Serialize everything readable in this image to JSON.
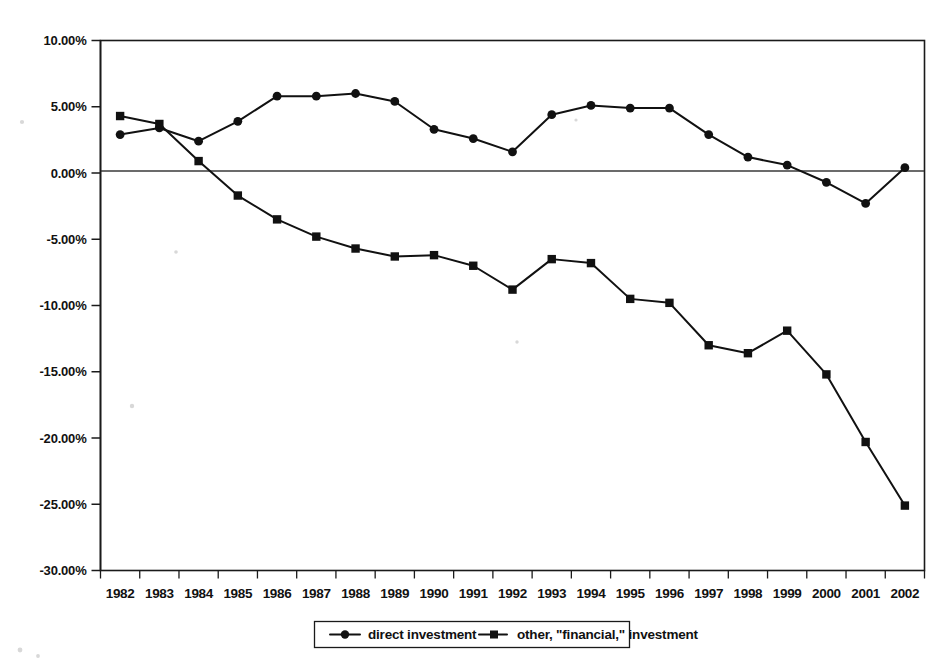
{
  "chart_data": {
    "type": "line",
    "title": "",
    "subtitle": "",
    "xlabel": "",
    "ylabel": "",
    "grid": false,
    "legend_position": "bottom",
    "x": [
      "1982",
      "1983",
      "1984",
      "1985",
      "1986",
      "1987",
      "1988",
      "1989",
      "1990",
      "1991",
      "1992",
      "1993",
      "1994",
      "1995",
      "1996",
      "1997",
      "1998",
      "1999",
      "2000",
      "2001",
      "2002"
    ],
    "categories": [
      "1982",
      "1983",
      "1984",
      "1985",
      "1986",
      "1987",
      "1988",
      "1989",
      "1990",
      "1991",
      "1992",
      "1993",
      "1994",
      "1995",
      "1996",
      "1997",
      "1998",
      "1999",
      "2000",
      "2001",
      "2002"
    ],
    "ylim": [
      -30.0,
      10.0
    ],
    "ytick_values": [
      10.0,
      5.0,
      0.0,
      -5.0,
      -10.0,
      -15.0,
      -20.0,
      -25.0,
      -30.0
    ],
    "ytick_labels": [
      "10.00%",
      "5.00%",
      "0.00%",
      "-5.00%",
      "-10.00%",
      "-15.00%",
      "-20.00%",
      "-25.00%",
      "-30.00%"
    ],
    "unit": "%",
    "series": [
      {
        "name": "direct investment",
        "marker": "circle",
        "values": [
          2.9,
          3.4,
          2.4,
          3.9,
          5.8,
          5.8,
          6.0,
          5.4,
          3.3,
          2.6,
          1.6,
          4.4,
          5.1,
          4.9,
          4.9,
          2.9,
          1.2,
          0.6,
          -0.7,
          -2.3,
          0.4
        ]
      },
      {
        "name": "other, \"financial,\" investment",
        "marker": "square",
        "values": [
          4.3,
          3.7,
          0.9,
          -1.7,
          -3.5,
          -4.8,
          -5.7,
          -6.3,
          -6.2,
          -7.0,
          -8.8,
          -6.5,
          -6.8,
          -9.5,
          -9.8,
          -13.0,
          -13.6,
          -11.9,
          -15.2,
          -20.3,
          -25.1
        ]
      }
    ]
  },
  "legend": {
    "entries": [
      {
        "label": "direct investment",
        "marker": "circle"
      },
      {
        "label": "other, \"financial,\" investment",
        "marker": "square"
      }
    ]
  }
}
